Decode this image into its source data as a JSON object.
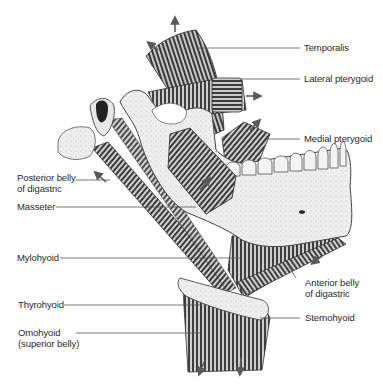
{
  "figure": {
    "colors": {
      "background": "#ffffff",
      "bone": "#eeeeee",
      "bone_outline": "#555555",
      "muscle_dark": "#3a3a3a",
      "muscle_mid": "#8a8a8a",
      "muscle_light": "#d6d6d6",
      "leader_line": "#555555",
      "label_text": "#2a2a2a",
      "arrow": "#555555"
    }
  },
  "labels": {
    "temporalis": "Temporalis",
    "lateral_pterygoid": "Lateral pterygoid",
    "medial_pterygoid": "Medial pterygoid",
    "posterior_belly_digastric": "Posterior belly\nof digastric",
    "masseter": "Masseter",
    "mylohyoid": "Mylohyoid",
    "anterior_belly_digastric": "Anterior belly\nof digastric",
    "thyrohyoid": "Thyrohyoid",
    "sternohyoid": "Sternohyoid",
    "omohyoid": "Omohyoid\n(superior belly)"
  }
}
